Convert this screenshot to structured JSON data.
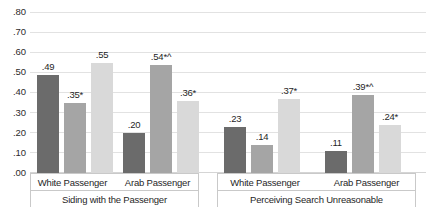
{
  "chart_data": {
    "type": "bar",
    "title": "",
    "xlabel": "",
    "ylabel": "",
    "ylim": [
      0.0,
      0.8
    ],
    "ytick_labels": [
      ".80",
      ".70",
      ".60",
      ".50",
      ".40",
      ".30",
      ".20",
      ".10",
      ".00"
    ],
    "ytick_values": [
      0.8,
      0.7,
      0.6,
      0.5,
      0.4,
      0.3,
      0.2,
      0.1,
      0.0
    ],
    "grid": true,
    "legend": "none",
    "panels": [
      {
        "label": "Siding with the Passenger",
        "categories": [
          "White Passenger",
          "Arab Passenger"
        ],
        "groups": [
          {
            "category": "White Passenger",
            "bars": [
              {
                "value": 0.49,
                "label": ".49"
              },
              {
                "value": 0.35,
                "label": ".35*"
              },
              {
                "value": 0.55,
                "label": ".55"
              }
            ]
          },
          {
            "category": "Arab Passenger",
            "bars": [
              {
                "value": 0.2,
                "label": ".20"
              },
              {
                "value": 0.54,
                "label": ".54*^"
              },
              {
                "value": 0.36,
                "label": ".36*"
              }
            ]
          }
        ]
      },
      {
        "label": "Perceiving Search Unreasonable",
        "categories": [
          "White Passenger",
          "Arab Passenger"
        ],
        "groups": [
          {
            "category": "White Passenger",
            "bars": [
              {
                "value": 0.23,
                "label": ".23"
              },
              {
                "value": 0.14,
                "label": ".14"
              },
              {
                "value": 0.37,
                "label": ".37*"
              }
            ]
          },
          {
            "category": "Arab Passenger",
            "bars": [
              {
                "value": 0.11,
                "label": ".11"
              },
              {
                "value": 0.39,
                "label": ".39*^"
              },
              {
                "value": 0.24,
                "label": ".24*"
              }
            ]
          }
        ]
      }
    ],
    "series_colors": [
      "#6b6b6b",
      "#a5a5a5",
      "#d9d9d9"
    ]
  }
}
